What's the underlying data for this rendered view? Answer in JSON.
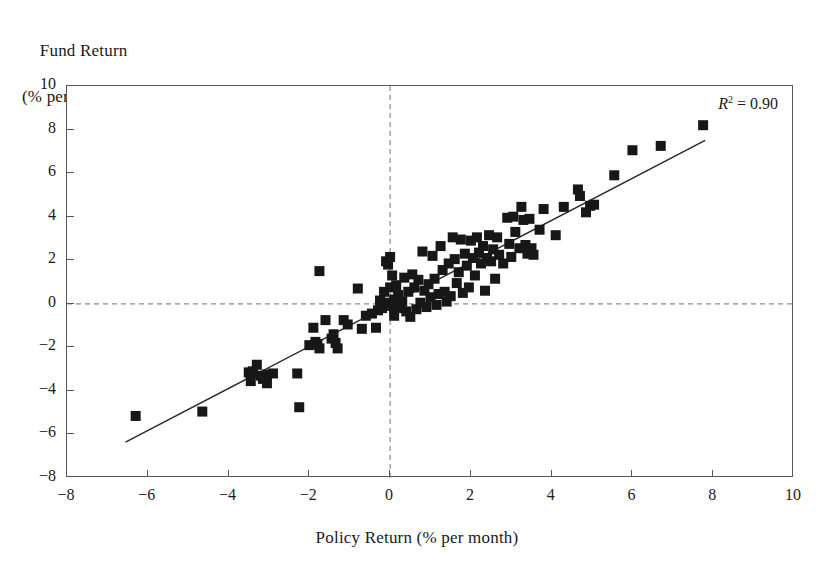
{
  "figure": {
    "ylabel_line1": "Fund Return",
    "ylabel_line2": "(% per month)",
    "xlabel": "Policy Return (% per month)",
    "annotation_symbol": "R",
    "annotation_exponent": "2",
    "annotation_value": "= 0.90",
    "annotation_full": "R² = 0.90"
  },
  "chart_data": {
    "type": "scatter",
    "title": "",
    "xlabel": "Policy Return (% per month)",
    "ylabel": "Fund Return (% per month)",
    "xlim": [
      -8,
      10
    ],
    "ylim": [
      -8,
      10
    ],
    "xticks": [
      -8,
      -6,
      -4,
      -2,
      0,
      2,
      4,
      6,
      8,
      10
    ],
    "yticks": [
      -8,
      -6,
      -4,
      -2,
      0,
      2,
      4,
      6,
      8,
      10
    ],
    "xtick_labels": [
      "−8",
      "−6",
      "−4",
      "−2",
      "0",
      "2",
      "4",
      "6",
      "8",
      "10"
    ],
    "ytick_labels": [
      "−8",
      "−6",
      "−4",
      "−2",
      "0",
      "2",
      "4",
      "6",
      "8",
      "10"
    ],
    "grid": false,
    "legend": false,
    "marker": "square",
    "marker_color": "#171717",
    "marker_size_px": 10,
    "r_squared": 0.9,
    "reference_lines": [
      {
        "name": "zero-horizontal",
        "orientation": "horizontal",
        "value": 0,
        "style": "dashed",
        "color": "#8d8d8d"
      },
      {
        "name": "zero-vertical",
        "orientation": "vertical",
        "value": 0,
        "style": "dashed",
        "color": "#8d8d8d"
      }
    ],
    "fit_line": {
      "name": "regression-line",
      "style": "solid",
      "color": "#2a2a2a",
      "x_start": -6.55,
      "y_start": -6.35,
      "x_end": 7.8,
      "y_end": 7.5,
      "slope": 0.963,
      "intercept": -0.03
    },
    "points": [
      [
        -6.3,
        -5.15
      ],
      [
        -4.65,
        -4.95
      ],
      [
        -3.5,
        -3.15
      ],
      [
        -3.45,
        -3.2
      ],
      [
        -3.4,
        -3.1
      ],
      [
        -3.3,
        -2.8
      ],
      [
        -3.45,
        -3.55
      ],
      [
        -3.2,
        -3.3
      ],
      [
        -3.15,
        -3.45
      ],
      [
        -3.05,
        -3.25
      ],
      [
        -3.05,
        -3.65
      ],
      [
        -2.9,
        -3.2
      ],
      [
        -2.3,
        -3.2
      ],
      [
        -2.25,
        -4.75
      ],
      [
        -2.0,
        -1.9
      ],
      [
        -1.9,
        -1.1
      ],
      [
        -1.85,
        -1.75
      ],
      [
        -1.8,
        -1.85
      ],
      [
        -1.75,
        -2.05
      ],
      [
        -1.75,
        1.5
      ],
      [
        -1.6,
        -0.75
      ],
      [
        -1.45,
        -1.6
      ],
      [
        -1.4,
        -1.4
      ],
      [
        -1.35,
        -1.8
      ],
      [
        -1.3,
        -2.05
      ],
      [
        -1.15,
        -0.75
      ],
      [
        -1.05,
        -0.95
      ],
      [
        -0.8,
        0.7
      ],
      [
        -0.7,
        -1.15
      ],
      [
        -0.6,
        -0.55
      ],
      [
        -0.45,
        -0.45
      ],
      [
        -0.35,
        -1.1
      ],
      [
        -0.3,
        -0.3
      ],
      [
        -0.25,
        0.15
      ],
      [
        -0.2,
        -0.2
      ],
      [
        -0.15,
        0.55
      ],
      [
        -0.1,
        1.95
      ],
      [
        -0.05,
        1.8
      ],
      [
        -0.05,
        0.05
      ],
      [
        0.0,
        2.15
      ],
      [
        0.0,
        0.75
      ],
      [
        0.05,
        -0.1
      ],
      [
        0.05,
        1.3
      ],
      [
        0.1,
        0.2
      ],
      [
        0.1,
        -0.55
      ],
      [
        0.15,
        0.85
      ],
      [
        0.2,
        0.4
      ],
      [
        0.25,
        -0.2
      ],
      [
        0.3,
        0.1
      ],
      [
        0.35,
        1.2
      ],
      [
        0.4,
        -0.35
      ],
      [
        0.45,
        0.55
      ],
      [
        0.5,
        -0.6
      ],
      [
        0.55,
        1.35
      ],
      [
        0.6,
        0.75
      ],
      [
        0.65,
        -0.25
      ],
      [
        0.7,
        1.1
      ],
      [
        0.75,
        0.05
      ],
      [
        0.8,
        2.4
      ],
      [
        0.85,
        0.6
      ],
      [
        0.9,
        -0.15
      ],
      [
        0.95,
        0.9
      ],
      [
        1.0,
        0.3
      ],
      [
        1.05,
        2.2
      ],
      [
        1.1,
        1.15
      ],
      [
        1.15,
        -0.05
      ],
      [
        1.2,
        0.45
      ],
      [
        1.25,
        2.65
      ],
      [
        1.3,
        1.55
      ],
      [
        1.35,
        0.55
      ],
      [
        1.4,
        0.1
      ],
      [
        1.45,
        1.85
      ],
      [
        1.5,
        0.35
      ],
      [
        1.55,
        3.05
      ],
      [
        1.6,
        2.05
      ],
      [
        1.65,
        0.95
      ],
      [
        1.7,
        1.45
      ],
      [
        1.75,
        2.95
      ],
      [
        1.8,
        0.5
      ],
      [
        1.85,
        2.3
      ],
      [
        1.9,
        1.75
      ],
      [
        1.95,
        0.75
      ],
      [
        2.0,
        2.9
      ],
      [
        2.05,
        2.1
      ],
      [
        2.1,
        1.3
      ],
      [
        2.15,
        3.05
      ],
      [
        2.2,
        2.35
      ],
      [
        2.25,
        1.85
      ],
      [
        2.3,
        2.65
      ],
      [
        2.35,
        0.6
      ],
      [
        2.4,
        2.1
      ],
      [
        2.45,
        3.15
      ],
      [
        2.5,
        1.95
      ],
      [
        2.55,
        2.5
      ],
      [
        2.6,
        1.15
      ],
      [
        2.65,
        3.05
      ],
      [
        2.7,
        2.25
      ],
      [
        2.8,
        1.85
      ],
      [
        2.9,
        3.95
      ],
      [
        2.95,
        2.75
      ],
      [
        3.0,
        2.15
      ],
      [
        3.05,
        4.0
      ],
      [
        3.1,
        3.3
      ],
      [
        3.2,
        2.55
      ],
      [
        3.25,
        4.45
      ],
      [
        3.3,
        3.85
      ],
      [
        3.35,
        2.7
      ],
      [
        3.4,
        2.3
      ],
      [
        3.45,
        3.9
      ],
      [
        3.5,
        2.55
      ],
      [
        3.55,
        2.25
      ],
      [
        3.7,
        3.4
      ],
      [
        3.8,
        4.35
      ],
      [
        4.1,
        3.15
      ],
      [
        4.3,
        4.45
      ],
      [
        4.65,
        5.25
      ],
      [
        4.7,
        4.95
      ],
      [
        4.85,
        4.2
      ],
      [
        4.95,
        4.5
      ],
      [
        5.05,
        4.55
      ],
      [
        5.55,
        5.9
      ],
      [
        6.0,
        7.05
      ],
      [
        6.7,
        7.25
      ],
      [
        7.75,
        8.2
      ]
    ]
  }
}
